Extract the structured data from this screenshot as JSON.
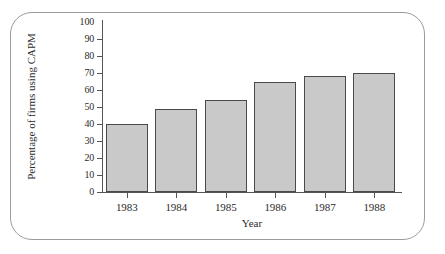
{
  "figure": {
    "frame_style": "rounded-rectangle-border",
    "border_color": "#9b9b9b",
    "background": "#ffffff"
  },
  "chart_data": {
    "type": "bar",
    "title": "",
    "categories": [
      "1983",
      "1984",
      "1985",
      "1986",
      "1987",
      "1988"
    ],
    "values": [
      40,
      49,
      54,
      65,
      68,
      70
    ],
    "xlabel": "Year",
    "ylabel": "Percentage of firms using CAPM",
    "ylim": [
      0,
      100
    ],
    "ytick_labels": [
      "0",
      "10",
      "20",
      "30",
      "40",
      "50",
      "60",
      "70",
      "80",
      "90",
      "100"
    ],
    "ytick_values": [
      0,
      10,
      20,
      30,
      40,
      50,
      60,
      70,
      80,
      90,
      100
    ],
    "xtick_labels": [
      "1983",
      "1984",
      "1985",
      "1986",
      "1987",
      "1988"
    ],
    "grid": false,
    "legend": null,
    "bar_fill_color": "#c9c9c9",
    "bar_edge_color": "#4a4a4a",
    "axis_color": "#555555"
  }
}
